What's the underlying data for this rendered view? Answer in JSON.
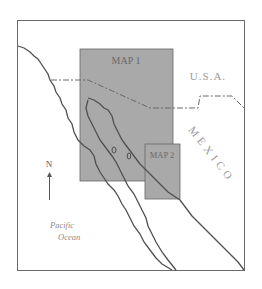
{
  "map": {
    "inset_labels": {
      "map1": "MAP 1",
      "map2": "MAP 2"
    },
    "country_labels": {
      "usa": "U.S.A.",
      "mexico": "MEXICO"
    },
    "water_labels": {
      "ocean_line1": "Pacific",
      "ocean_line2": "Ocean"
    },
    "north_arrow_label": "N",
    "colors": {
      "inset_fill": "#a9a9a9",
      "line": "#555555",
      "text": "#8a8a8a",
      "frame": "#6a6a6a"
    }
  }
}
